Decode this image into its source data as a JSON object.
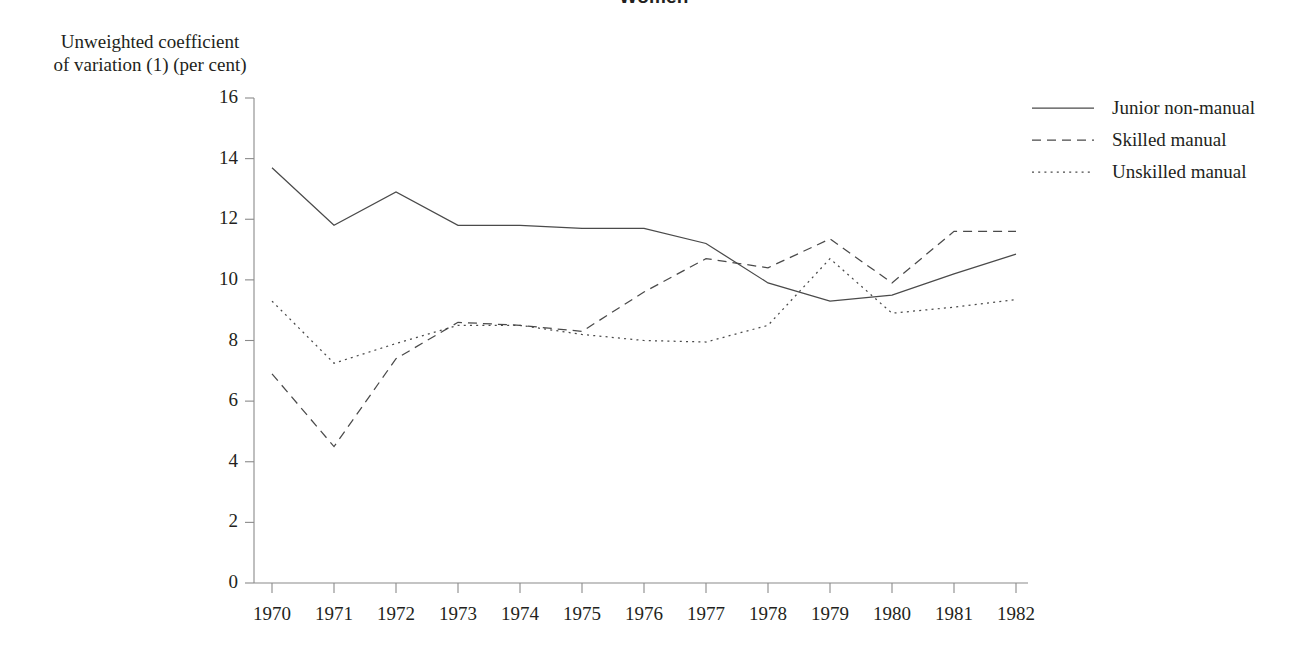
{
  "chart_data": {
    "type": "line",
    "title": "Women",
    "ylabel_line1": "Unweighted coefficient",
    "ylabel_line2": "of variation (1) (per cent)",
    "xlabel": "",
    "grid": false,
    "legend_position": "right",
    "ylim": [
      0,
      16
    ],
    "yticks": [
      0,
      2,
      4,
      6,
      8,
      10,
      12,
      14,
      16
    ],
    "categories": [
      1970,
      1971,
      1972,
      1973,
      1974,
      1975,
      1976,
      1977,
      1978,
      1979,
      1980,
      1981,
      1982
    ],
    "xticklabels": [
      "1970",
      "1971",
      "1972",
      "1973",
      "1974",
      "1975",
      "1976",
      "1977",
      "1978",
      "1979",
      "1980",
      "1981",
      "1982"
    ],
    "series": [
      {
        "name": "Junior non-manual",
        "style": "solid",
        "color": "#4a4a4a",
        "values": [
          13.7,
          11.8,
          12.9,
          11.8,
          11.8,
          11.7,
          11.7,
          11.2,
          9.9,
          9.3,
          9.5,
          10.2,
          10.85
        ]
      },
      {
        "name": "Skilled manual",
        "style": "dashed",
        "color": "#4a4a4a",
        "values": [
          6.9,
          4.5,
          7.4,
          8.6,
          8.5,
          8.3,
          9.6,
          10.7,
          10.4,
          11.35,
          9.9,
          11.6,
          11.6
        ]
      },
      {
        "name": "Unskilled manual",
        "style": "dotted",
        "color": "#4a4a4a",
        "values": [
          9.3,
          7.25,
          7.9,
          8.5,
          8.5,
          8.2,
          8.0,
          7.95,
          8.5,
          10.7,
          8.9,
          9.1,
          9.35
        ]
      }
    ]
  },
  "legend": {
    "items": [
      {
        "label": "Junior non-manual",
        "style": "solid"
      },
      {
        "label": "Skilled manual",
        "style": "dashed"
      },
      {
        "label": "Unskilled manual",
        "style": "dotted"
      }
    ]
  }
}
